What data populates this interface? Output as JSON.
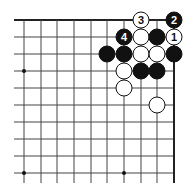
{
  "diagram": {
    "type": "go-board-corner",
    "colors": {
      "background": "#ffffff",
      "line": "#444444",
      "edge": "#222222",
      "black": "#111111",
      "white": "#ffffff"
    },
    "grid": {
      "columns_x": [
        24,
        41,
        57,
        74,
        91,
        107,
        124,
        141,
        157,
        174
      ],
      "rows_y": [
        20,
        37,
        54,
        71,
        88,
        105,
        122,
        139,
        156,
        173
      ],
      "extend_left": 14,
      "extend_bottom": 183,
      "top_edge": true,
      "right_edge": true
    },
    "star_points": [
      {
        "col": 0,
        "row": 3
      },
      {
        "col": 0,
        "row": 9
      },
      {
        "col": 6,
        "row": 9
      }
    ],
    "stones": [
      {
        "col": 7,
        "row": 0,
        "color": "white",
        "label": "3"
      },
      {
        "col": 9,
        "row": 0,
        "color": "black",
        "label": "2"
      },
      {
        "col": 6,
        "row": 1,
        "color": "black",
        "label": "4"
      },
      {
        "col": 7,
        "row": 1,
        "color": "white",
        "label": ""
      },
      {
        "col": 8,
        "row": 1,
        "color": "black",
        "label": ""
      },
      {
        "col": 9,
        "row": 1,
        "color": "white",
        "label": "1"
      },
      {
        "col": 5,
        "row": 2,
        "color": "black",
        "label": ""
      },
      {
        "col": 6,
        "row": 2,
        "color": "black",
        "label": ""
      },
      {
        "col": 7,
        "row": 2,
        "color": "white",
        "label": ""
      },
      {
        "col": 8,
        "row": 2,
        "color": "white",
        "label": ""
      },
      {
        "col": 9,
        "row": 2,
        "color": "black",
        "label": ""
      },
      {
        "col": 6,
        "row": 3,
        "color": "white",
        "label": ""
      },
      {
        "col": 7,
        "row": 3,
        "color": "black",
        "label": ""
      },
      {
        "col": 8,
        "row": 3,
        "color": "black",
        "label": ""
      },
      {
        "col": 6,
        "row": 4,
        "color": "white",
        "label": ""
      },
      {
        "col": 8,
        "row": 5,
        "color": "white",
        "label": ""
      }
    ]
  }
}
